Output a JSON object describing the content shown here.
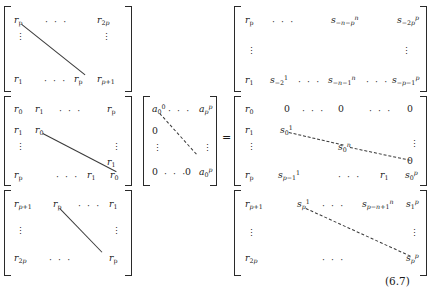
{
  "equation": {
    "number": "(6.7)",
    "equals": "=",
    "dots_h": "· · ·",
    "dots_v": "⋮",
    "lhs_blocks": [
      {
        "name": "r-block-top",
        "cells": [
          {
            "t": "r",
            "sub": "p"
          },
          {
            "t": "r",
            "sub": "2p"
          },
          {
            "t": "r",
            "sub": "1"
          },
          {
            "t": "r",
            "sub": "p"
          },
          {
            "t": "r",
            "sub": "p+1"
          }
        ]
      },
      {
        "name": "r-block-middle",
        "cells": [
          {
            "t": "r",
            "sub": "0"
          },
          {
            "t": "r",
            "sub": "1"
          },
          {
            "t": "r",
            "sub": "p"
          },
          {
            "t": "r",
            "sub": "1"
          },
          {
            "t": "r",
            "sub": "0"
          },
          {
            "t": "r",
            "sub": "1"
          },
          {
            "t": "r",
            "sub": "p"
          },
          {
            "t": "r",
            "sub": "1"
          },
          {
            "t": "r",
            "sub": "0"
          }
        ]
      },
      {
        "name": "r-block-bottom",
        "cells": [
          {
            "t": "r",
            "sub": "p+1"
          },
          {
            "t": "r",
            "sub": "p"
          },
          {
            "t": "r",
            "sub": "1"
          },
          {
            "t": "r",
            "sub": "2p"
          },
          {
            "t": "r",
            "sub": "p"
          }
        ]
      }
    ],
    "a_matrix": {
      "name": "a-coefficient-matrix",
      "cells": [
        {
          "t": "a",
          "sub": "0",
          "sup": "0"
        },
        {
          "t": "a",
          "sub": "p",
          "sup": "p"
        },
        {
          "t": "0"
        },
        {
          "t": "0"
        },
        {
          "t": "0"
        },
        {
          "t": "a",
          "sub": "0",
          "sup": "p"
        }
      ]
    },
    "rhs_blocks": [
      {
        "name": "s-block-top",
        "cells": [
          {
            "t": "r",
            "sub": "p"
          },
          {
            "t": "s",
            "sub": "−n−p",
            "sup": "n"
          },
          {
            "t": "s",
            "sub": "−2p",
            "sup": "p"
          },
          {
            "t": "r",
            "sub": "1"
          },
          {
            "t": "s",
            "sub": "−2",
            "sup": "1"
          },
          {
            "t": "s",
            "sub": "−n−1",
            "sup": "n"
          },
          {
            "t": "s",
            "sub": "−p−1",
            "sup": "p"
          }
        ]
      },
      {
        "name": "s-block-middle",
        "cells": [
          {
            "t": "r",
            "sub": "0"
          },
          {
            "t": "0"
          },
          {
            "t": "0"
          },
          {
            "t": "0"
          },
          {
            "t": "r",
            "sub": "1"
          },
          {
            "t": "s",
            "sub": "0",
            "sup": "1"
          },
          {
            "t": "s",
            "sub": "0",
            "sup": "n"
          },
          {
            "t": "0"
          },
          {
            "t": "r",
            "sub": "p"
          },
          {
            "t": "s",
            "sub": "p−1",
            "sup": "1"
          },
          {
            "t": "r",
            "sub": "1"
          },
          {
            "t": "s",
            "sub": "0",
            "sup": "p"
          }
        ]
      },
      {
        "name": "s-block-bottom",
        "cells": [
          {
            "t": "r",
            "sub": "p+1"
          },
          {
            "t": "s",
            "sub": "p",
            "sup": "1"
          },
          {
            "t": "s",
            "sub": "p−n+1",
            "sup": "n"
          },
          {
            "t": "s",
            "sub": "1",
            "sup": "p"
          },
          {
            "t": "r",
            "sub": "2p"
          },
          {
            "t": "s",
            "sub": "p",
            "sup": "p"
          }
        ]
      }
    ]
  }
}
